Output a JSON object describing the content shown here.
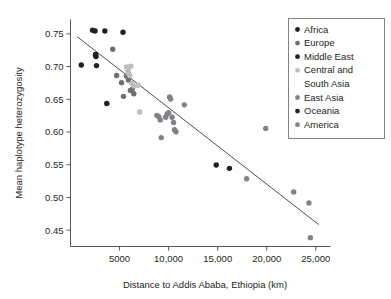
{
  "chart_data": {
    "type": "scatter",
    "title": "",
    "xlabel": "Distance to Addis Ababa, Ethiopia (km)",
    "ylabel": "Mean haplotype heterozygosity",
    "xlim": [
      0,
      26500
    ],
    "ylim": [
      0.425,
      0.772
    ],
    "xticks": [
      5000,
      10000,
      15000,
      20000,
      25000
    ],
    "xtick_labels": [
      "5000",
      "10,000",
      "15,000",
      "20,000",
      "25,000"
    ],
    "yticks": [
      0.45,
      0.5,
      0.55,
      0.6,
      0.65,
      0.7,
      0.75
    ],
    "ytick_labels": [
      "0.45",
      "0.50",
      "0.55",
      "0.60",
      "0.65",
      "0.70",
      "0.75"
    ],
    "grid": false,
    "legend_position": "top-right",
    "trend_line": {
      "label": "linear regression",
      "x_start": 700,
      "y_start": 0.7455,
      "x_end": 25300,
      "y_end": 0.4585,
      "color": "#4d4d4f"
    },
    "series": [
      {
        "name": "Africa",
        "color": "#231f20",
        "points": [
          [
            1100,
            0.7025
          ],
          [
            2250,
            0.7555
          ],
          [
            2500,
            0.7545
          ],
          [
            2550,
            0.7175
          ],
          [
            2600,
            0.7155
          ],
          [
            2650,
            0.7015
          ],
          [
            3500,
            0.7545
          ],
          [
            3700,
            0.6435
          ]
        ]
      },
      {
        "name": "Europe",
        "color": "#6d6e71",
        "points": [
          [
            4300,
            0.7265
          ],
          [
            4700,
            0.6865
          ],
          [
            5200,
            0.6755
          ],
          [
            5400,
            0.6545
          ],
          [
            5700,
            0.6855
          ],
          [
            5900,
            0.6795
          ],
          [
            6100,
            0.6635
          ],
          [
            6300,
            0.6655
          ],
          [
            6450,
            0.6585
          ]
        ]
      },
      {
        "name": "Middle East",
        "color": "#231f20",
        "points": [
          [
            5350,
            0.7525
          ],
          [
            2560,
            0.7185
          ]
        ]
      },
      {
        "name": "Central and South Asia",
        "color": "#bcbec0",
        "points": [
          [
            5700,
            0.6995
          ],
          [
            5850,
            0.6935
          ],
          [
            5900,
            0.6905
          ],
          [
            5950,
            0.6885
          ],
          [
            6000,
            0.6995
          ],
          [
            6050,
            0.6865
          ],
          [
            6150,
            0.7005
          ],
          [
            6250,
            0.6745
          ],
          [
            6500,
            0.6705
          ],
          [
            6900,
            0.6715
          ],
          [
            7050,
            0.6305
          ]
        ]
      },
      {
        "name": "East Asia",
        "color": "#808285",
        "points": [
          [
            8800,
            0.6255
          ],
          [
            9000,
            0.6235
          ],
          [
            9150,
            0.6185
          ],
          [
            9250,
            0.5915
          ],
          [
            9700,
            0.6225
          ],
          [
            9850,
            0.6275
          ],
          [
            10000,
            0.6295
          ],
          [
            10100,
            0.6535
          ],
          [
            10200,
            0.6505
          ],
          [
            10350,
            0.6225
          ],
          [
            10500,
            0.6145
          ],
          [
            10600,
            0.6035
          ],
          [
            10750,
            0.6005
          ],
          [
            11600,
            0.6415
          ]
        ]
      },
      {
        "name": "Oceania",
        "color": "#231f20",
        "points": [
          [
            14850,
            0.5495
          ],
          [
            16200,
            0.5445
          ]
        ]
      },
      {
        "name": "America",
        "color": "#808285",
        "points": [
          [
            17950,
            0.5285
          ],
          [
            19900,
            0.6055
          ],
          [
            22750,
            0.5085
          ],
          [
            24300,
            0.4915
          ],
          [
            24450,
            0.4385
          ]
        ]
      }
    ]
  },
  "legend": {
    "entries": [
      {
        "label": "Africa",
        "color": "#231f20"
      },
      {
        "label": "Europe",
        "color": "#6d6e71"
      },
      {
        "label": "Middle East",
        "color": "#231f20"
      },
      {
        "label": "Central and",
        "label2": "South Asia",
        "color": "#bcbec0"
      },
      {
        "label": "East Asia",
        "color": "#808285"
      },
      {
        "label": "Oceania",
        "color": "#231f20"
      },
      {
        "label": "America",
        "color": "#808285"
      }
    ]
  }
}
